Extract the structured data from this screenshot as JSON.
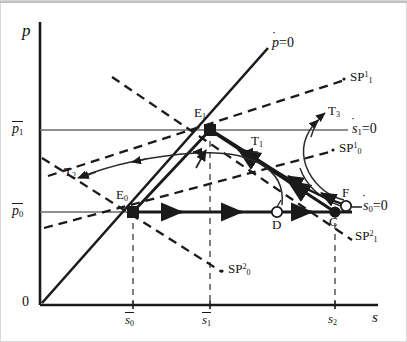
{
  "figure": {
    "type": "phase-diagram",
    "axes": {
      "y_label": "p",
      "x_label": "s",
      "origin_label": "0",
      "y_ticks": [
        {
          "id": "p0",
          "label": "p",
          "bar": true,
          "sub": "0",
          "y": 212
        },
        {
          "id": "p1",
          "label": "p",
          "bar": true,
          "sub": "1",
          "y": 130
        }
      ],
      "x_ticks": [
        {
          "id": "s0",
          "label": "s",
          "bar": true,
          "sub": "0",
          "x": 133
        },
        {
          "id": "s1",
          "label": "s",
          "bar": true,
          "sub": "1",
          "x": 210
        },
        {
          "id": "s2",
          "label": "s",
          "bar": false,
          "sub": "2",
          "x": 335
        }
      ]
    },
    "curve_labels": [
      {
        "id": "pdot0",
        "name": "p-dot-zero-label",
        "text": "p=0",
        "dot": "p",
        "x": 272,
        "y": 38
      },
      {
        "id": "sdot1",
        "name": "s1-dot-zero-label",
        "text": "s",
        "dot": "s",
        "sub": "1",
        "suffix": "=0",
        "x": 342,
        "y": 124
      },
      {
        "id": "sdot0",
        "name": "s0-dot-zero-label",
        "text": "s",
        "dot": "s",
        "sub": "0",
        "suffix": "=0",
        "x": 358,
        "y": 206
      },
      {
        "id": "sp11",
        "name": "sp-1-1-label",
        "base": "SP",
        "sup": "1",
        "sub": "1",
        "x": 352,
        "y": 78
      },
      {
        "id": "sp10",
        "name": "sp-1-0-label",
        "base": "SP",
        "sup": "1",
        "sub": "0",
        "x": 340,
        "y": 148
      },
      {
        "id": "sp21",
        "name": "sp-2-1-label",
        "base": "SP",
        "sup": "2",
        "sub": "1",
        "x": 355,
        "y": 236
      },
      {
        "id": "sp20",
        "name": "sp-2-0-label",
        "base": "SP",
        "sup": "2",
        "sub": "0",
        "x": 228,
        "y": 268
      }
    ],
    "trajectory_labels": [
      {
        "id": "T1",
        "base": "T",
        "sub": "1",
        "x": 253,
        "y": 142
      },
      {
        "id": "T2",
        "base": "T",
        "sub": "2",
        "x": 68,
        "y": 172
      },
      {
        "id": "T3",
        "base": "T",
        "sub": "3",
        "x": 330,
        "y": 111
      }
    ],
    "points": [
      {
        "id": "E0",
        "base": "E",
        "sub": "0",
        "marker": "filled-square",
        "x": 133,
        "y": 212,
        "label_dx": -4,
        "label_dy": -20
      },
      {
        "id": "E1",
        "base": "E",
        "sub": "1",
        "marker": "filled-square",
        "x": 210,
        "y": 130,
        "label_dx": -4,
        "label_dy": -20
      },
      {
        "id": "C",
        "base": "C",
        "sub": "",
        "marker": "filled-circle",
        "x": 335,
        "y": 212,
        "label_dx": -4,
        "label_dy": 6
      },
      {
        "id": "D",
        "base": "D",
        "sub": "",
        "marker": "open-circle",
        "x": 277,
        "y": 212,
        "label_dx": -4,
        "label_dy": 6
      },
      {
        "id": "F",
        "base": "F",
        "sub": "",
        "marker": "open-circle",
        "x": 345,
        "y": 205,
        "label_dx": -3,
        "label_dy": -20
      }
    ],
    "colors": {
      "ink": "#1a1a1a",
      "axis": "#1a1a1a",
      "gridline": "#5a5a5a",
      "dashed": "#1a1a1a",
      "border": "#c8c8c8"
    }
  }
}
